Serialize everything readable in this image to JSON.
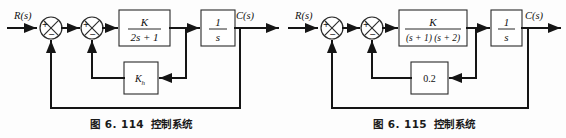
{
  "page": {
    "background": "#fdfdfd",
    "ink": "#151515"
  },
  "figures": [
    {
      "id": "fig-6-114",
      "caption_number": "图 6. 114",
      "caption_title": "控制系统",
      "input_label": "R(s)",
      "output_label": "C(s)",
      "sum1": {
        "left_sign": "+",
        "bottom_sign": "−"
      },
      "sum2": {
        "left_sign": "+",
        "bottom_sign": "−"
      },
      "forward_block": {
        "numerator": "K",
        "denominator": "2s + 1"
      },
      "integrator_block": {
        "numerator": "1",
        "denominator": "s"
      },
      "feedback_block": {
        "label": "K",
        "subscript": "h"
      }
    },
    {
      "id": "fig-6-115",
      "caption_number": "图 6. 115",
      "caption_title": "控制系统",
      "input_label": "R(s)",
      "output_label": "C(s)",
      "sum1": {
        "left_sign": "+",
        "bottom_sign": "−"
      },
      "sum2": {
        "left_sign": "+",
        "bottom_sign": "−"
      },
      "forward_block": {
        "numerator": "K",
        "denominator": "(s + 1) (s + 2)"
      },
      "integrator_block": {
        "numerator": "1",
        "denominator": "s"
      },
      "feedback_block": {
        "label": "0.2",
        "subscript": ""
      }
    }
  ]
}
